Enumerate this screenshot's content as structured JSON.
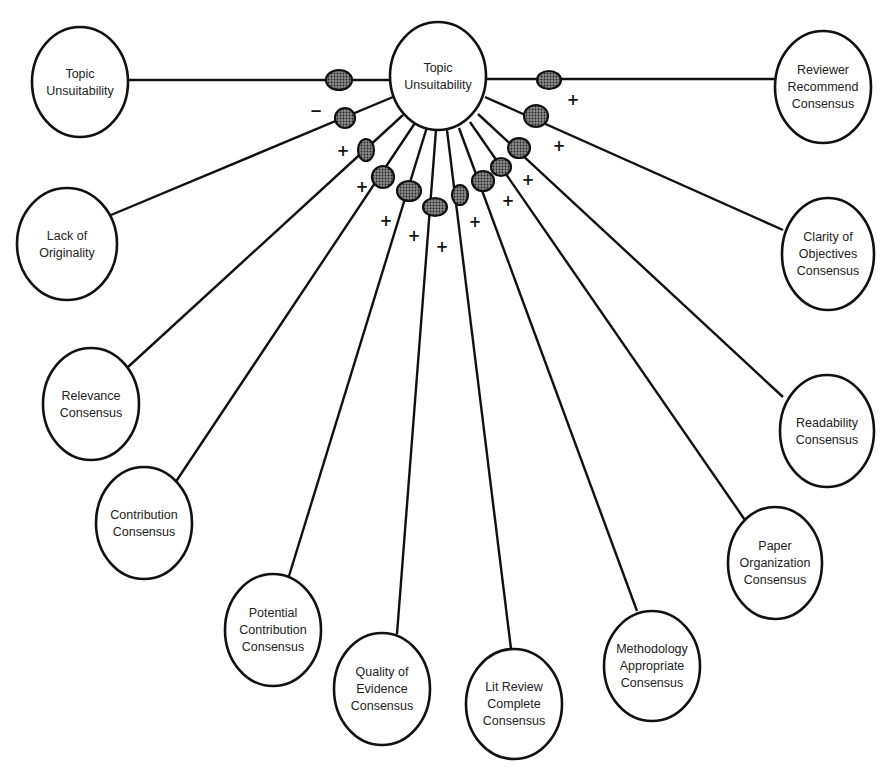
{
  "diagram": {
    "type": "causal-map",
    "center": {
      "id": "center",
      "label": [
        "Topic",
        "Unsuitability"
      ],
      "cx": 438,
      "cy": 76,
      "rx": 48,
      "ry": 54
    },
    "nodes": [
      {
        "id": "topic",
        "label": [
          "Topic",
          "Unsuitability"
        ],
        "cx": 80,
        "cy": 82,
        "rx": 48,
        "ry": 55,
        "dot": [
          339,
          80,
          13,
          10
        ],
        "sign": "",
        "sign_pos": [
          0,
          0
        ],
        "attach": [
          128,
          80
        ],
        "center_attach": [
          390,
          80
        ]
      },
      {
        "id": "originality",
        "label": [
          "Lack of",
          "Originality"
        ],
        "cx": 67,
        "cy": 244,
        "rx": 50,
        "ry": 56,
        "dot": [
          345,
          118,
          10,
          10
        ],
        "sign": "−",
        "sign_pos": [
          316,
          116
        ],
        "attach": [
          111,
          215
        ],
        "center_attach": [
          393,
          97
        ]
      },
      {
        "id": "relevance",
        "label": [
          "Relevance",
          "Consensus"
        ],
        "cx": 91,
        "cy": 404,
        "rx": 48,
        "ry": 56,
        "dot": [
          366,
          150,
          8,
          11
        ],
        "sign": "+",
        "sign_pos": [
          343,
          156
        ],
        "attach": [
          128,
          367
        ],
        "center_attach": [
          403,
          115
        ]
      },
      {
        "id": "contribution",
        "label": [
          "Contribution",
          "Consensus"
        ],
        "cx": 144,
        "cy": 523,
        "rx": 48,
        "ry": 56,
        "dot": [
          383,
          177,
          11,
          11
        ],
        "sign": "+",
        "sign_pos": [
          362,
          192
        ],
        "attach": [
          175,
          483
        ],
        "center_attach": [
          415,
          123
        ]
      },
      {
        "id": "potential",
        "label": [
          "Potential",
          "Contribution",
          "Consensus"
        ],
        "cx": 273,
        "cy": 630,
        "rx": 48,
        "ry": 56,
        "dot": [
          409,
          191,
          12,
          10
        ],
        "sign": "+",
        "sign_pos": [
          386,
          226
        ],
        "attach": [
          289,
          576
        ],
        "center_attach": [
          427,
          127
        ]
      },
      {
        "id": "quality",
        "label": [
          "Quality of",
          "Evidence",
          "Consensus"
        ],
        "cx": 382,
        "cy": 689,
        "rx": 48,
        "ry": 56,
        "dot": [
          435,
          207,
          12,
          9
        ],
        "sign": "+",
        "sign_pos": [
          414,
          241
        ],
        "attach": [
          397,
          634
        ],
        "center_attach": [
          436,
          130
        ]
      },
      {
        "id": "litreview",
        "label": [
          "Lit Review",
          "Complete",
          "Consensus"
        ],
        "cx": 514,
        "cy": 704,
        "rx": 48,
        "ry": 55,
        "dot": [
          460,
          195,
          8,
          10
        ],
        "sign": "+",
        "sign_pos": [
          442,
          252
        ],
        "attach": [
          511,
          649
        ],
        "center_attach": [
          447,
          130
        ]
      },
      {
        "id": "methodology",
        "label": [
          "Methodology",
          "Appropriate",
          "Consensus"
        ],
        "cx": 652,
        "cy": 666,
        "rx": 48,
        "ry": 55,
        "dot": [
          483,
          181,
          11,
          10
        ],
        "sign": "+",
        "sign_pos": [
          475,
          227
        ],
        "attach": [
          637,
          611
        ],
        "center_attach": [
          459,
          128
        ]
      },
      {
        "id": "paperorg",
        "label": [
          "Paper",
          "Organization",
          "Consensus"
        ],
        "cx": 775,
        "cy": 563,
        "rx": 47,
        "ry": 56,
        "dot": [
          501,
          167,
          10,
          9
        ],
        "sign": "+",
        "sign_pos": [
          508,
          206
        ],
        "attach": [
          747,
          523
        ],
        "center_attach": [
          470,
          122
        ]
      },
      {
        "id": "readability",
        "label": [
          "Readability",
          "Consensus"
        ],
        "cx": 827,
        "cy": 431,
        "rx": 47,
        "ry": 56,
        "dot": [
          519,
          148,
          11,
          10
        ],
        "sign": "+",
        "sign_pos": [
          528,
          185
        ],
        "attach": [
          783,
          397
        ],
        "center_attach": [
          478,
          114
        ]
      },
      {
        "id": "clarity",
        "label": [
          "Clarity of",
          "Objectives",
          "Consensus"
        ],
        "cx": 828,
        "cy": 254,
        "rx": 46,
        "ry": 56,
        "dot": [
          536,
          116,
          12,
          11
        ],
        "sign": "+",
        "sign_pos": [
          559,
          151
        ],
        "attach": [
          783,
          230
        ],
        "center_attach": [
          485,
          97
        ]
      },
      {
        "id": "reviewer",
        "label": [
          "Reviewer",
          "Recommend",
          "Consensus"
        ],
        "cx": 823,
        "cy": 87,
        "rx": 48,
        "ry": 56,
        "dot": [
          549,
          80,
          12,
          9
        ],
        "sign": "+",
        "sign_pos": [
          573,
          105
        ],
        "attach": [
          775,
          79
        ],
        "center_attach": [
          487,
          79
        ]
      }
    ]
  },
  "colors": {
    "stroke": "#111111",
    "background": "#ffffff",
    "dot_fill": "#555555"
  }
}
